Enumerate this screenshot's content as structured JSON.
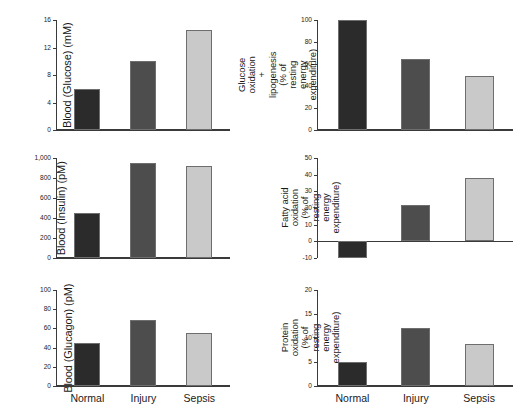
{
  "figure": {
    "categories": [
      "Normal",
      "Injury",
      "Sepsis"
    ],
    "series_colors": {
      "normal": "#2b2b2b",
      "injury": "#4d4d4d",
      "sepsis": "#c9c9c9"
    }
  },
  "chart_data": [
    {
      "id": "blood-glucose",
      "type": "bar",
      "title": "",
      "ylabel": "Blood (Glucose) (mM)",
      "ylabel_lines": [
        "Blood (Glucose) (mM)"
      ],
      "xlabel": "",
      "categories": [
        "Normal",
        "Injury",
        "Sepsis"
      ],
      "values": [
        6.0,
        10.0,
        14.5
      ],
      "ticks": [
        0,
        4,
        8,
        12,
        16
      ],
      "ticklabels": [
        "0",
        "4",
        "8",
        "12",
        "16"
      ],
      "ylim": [
        0,
        16
      ],
      "grid": false,
      "legend": "none"
    },
    {
      "id": "glucose-oxidation-lipogenesis",
      "type": "bar",
      "title": "",
      "ylabel": "Glucose oxidation + lipogenesis (% of resting energy expenditure)",
      "ylabel_lines": [
        "Glucose oxidation",
        "+ lipogenesis",
        "(% of resting",
        "energy expenditure)"
      ],
      "xlabel": "",
      "categories": [
        "Normal",
        "Injury",
        "Sepsis"
      ],
      "values": [
        100,
        65,
        49
      ],
      "ticks": [
        0,
        20,
        40,
        60,
        80,
        100
      ],
      "ticklabels": [
        "0",
        "20",
        "40",
        "60",
        "80",
        "100"
      ],
      "ylim": [
        0,
        100
      ],
      "grid": false,
      "legend": "none"
    },
    {
      "id": "blood-insulin",
      "type": "bar",
      "title": "",
      "ylabel": "Blood (Insulin) (pM)",
      "ylabel_lines": [
        "Blood (Insulin) (pM)"
      ],
      "xlabel": "",
      "categories": [
        "Normal",
        "Injury",
        "Sepsis"
      ],
      "values": [
        450,
        955,
        925
      ],
      "ticks": [
        0,
        200,
        400,
        600,
        800,
        1000
      ],
      "ticklabels": [
        "0",
        "200",
        "400",
        "600",
        "800",
        "1,000"
      ],
      "ylim": [
        0,
        1000
      ],
      "grid": false,
      "legend": "none"
    },
    {
      "id": "fatty-acid-oxidation",
      "type": "bar",
      "title": "",
      "ylabel": "Fatty acid oxidation (% of resting energy expenditure)",
      "ylabel_lines": [
        "Fatty acid oxidation",
        "(% of resting",
        "energy expenditure)"
      ],
      "xlabel": "",
      "categories": [
        "Normal",
        "Injury",
        "Sepsis"
      ],
      "values": [
        -10,
        22,
        38
      ],
      "ticks": [
        -10,
        0,
        10,
        20,
        30,
        40,
        50
      ],
      "ticklabels": [
        "-10",
        "0",
        "10",
        "20",
        "30",
        "40",
        "50"
      ],
      "ylim": [
        -10,
        50
      ],
      "grid": false,
      "legend": "none"
    },
    {
      "id": "blood-glucagon",
      "type": "bar",
      "title": "",
      "ylabel": "Blood (Glucagon) (pM)",
      "ylabel_lines": [
        "Blood (Glucagon) (pM)"
      ],
      "xlabel": "",
      "categories": [
        "Normal",
        "Injury",
        "Sepsis"
      ],
      "values": [
        45,
        69,
        55
      ],
      "ticks": [
        0,
        20,
        40,
        60,
        80,
        100
      ],
      "ticklabels": [
        "0",
        "20",
        "40",
        "60",
        "80",
        "100"
      ],
      "ylim": [
        0,
        100
      ],
      "grid": false,
      "legend": "none"
    },
    {
      "id": "protein-oxidation",
      "type": "bar",
      "title": "",
      "ylabel": "Protein oxidation (% of resting energy expenditure)",
      "ylabel_lines": [
        "Protein oxidation",
        "(% of resting",
        "energy expenditure)"
      ],
      "xlabel": "",
      "categories": [
        "Normal",
        "Injury",
        "Sepsis"
      ],
      "values": [
        5,
        12,
        8.8
      ],
      "ticks": [
        0,
        5,
        10,
        15,
        20
      ],
      "ticklabels": [
        "0",
        "5",
        "10",
        "15",
        "20"
      ],
      "ylim": [
        0,
        20
      ],
      "grid": false,
      "legend": "none"
    }
  ]
}
